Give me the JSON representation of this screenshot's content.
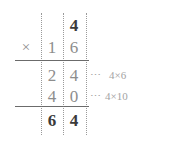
{
  "problem": {
    "type": "long-multiplication",
    "multiplicand": "4",
    "multiplier": "16",
    "product": "64",
    "operator": "×"
  },
  "grid": {
    "rows": [
      {
        "name": "multiplicand-row",
        "tens": "",
        "ones": "4",
        "emphasis": "dark"
      },
      {
        "name": "multiplier-row",
        "operator": "×",
        "tens": "1",
        "ones": "6",
        "emphasis": "gray"
      },
      {
        "name": "partial-product-1",
        "tens": "2",
        "ones": "4",
        "emphasis": "gray",
        "annotation_dots": "⋯",
        "annotation_expr": "4×6"
      },
      {
        "name": "partial-product-2",
        "tens": "4",
        "ones": "0",
        "emphasis": "gray",
        "annotation_dots": "⋯",
        "annotation_expr": "4×10"
      },
      {
        "name": "answer-row",
        "tens": "6",
        "ones": "4",
        "emphasis": "dark"
      }
    ]
  },
  "colors": {
    "dark_digit": "#3a3a3a",
    "gray_digit": "#8d8d8d",
    "annotation": "#a3a3a3",
    "rule": "#6b6b6b",
    "guide": "#9a9a9a",
    "background": "#ffffff"
  }
}
